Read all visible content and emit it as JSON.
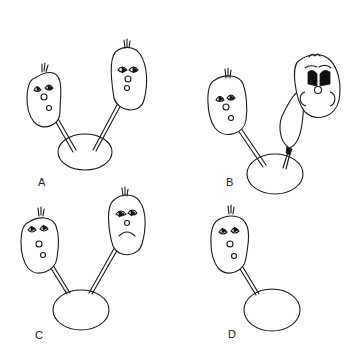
{
  "figure": {
    "panels": [
      {
        "label": "A",
        "characters": [
          {
            "expression": "content",
            "straw": true
          },
          {
            "expression": "content",
            "straw": true
          }
        ],
        "pool": true
      },
      {
        "label": "B",
        "characters": [
          {
            "expression": "content",
            "straw": true
          },
          {
            "expression": "alarmed-bloated",
            "straw": true,
            "note": "straw swollen/blocked"
          }
        ],
        "pool": true
      },
      {
        "label": "C",
        "characters": [
          {
            "expression": "content",
            "straw": true
          },
          {
            "expression": "sad",
            "straw": true
          }
        ],
        "pool": true
      },
      {
        "label": "D",
        "characters": [
          {
            "expression": "content",
            "straw": true
          }
        ],
        "pool": true
      }
    ]
  },
  "colors": {
    "ink": "#1a1a1a",
    "background": "#ffffff"
  }
}
